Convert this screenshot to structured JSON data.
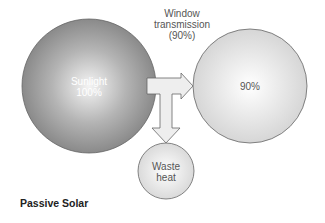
{
  "diagram": {
    "title": "Passive Solar",
    "nodes": {
      "sunlight": {
        "line1": "Sunlight",
        "line2": "100%"
      },
      "transmitted": {
        "line1": "90%"
      },
      "waste": {
        "line1": "Waste",
        "line2": "heat"
      }
    },
    "edge_label": {
      "line1": "Window",
      "line2": "transmission",
      "line3": "(90%)"
    },
    "colors": {
      "sunlight_edge": "#8a8a8a",
      "sunlight_center": "#f2f2f2",
      "transmitted_edge": "#d4d4d4",
      "waste_edge": "#d8d8d8",
      "arrow_fill": "#eeeeee",
      "stroke": "#666666"
    }
  }
}
